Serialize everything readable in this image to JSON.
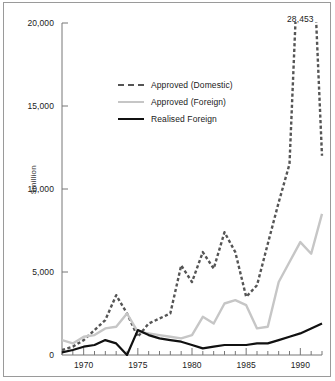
{
  "chart_data": {
    "type": "line",
    "title": "",
    "xlabel": "",
    "ylabel": "$million",
    "xlim": [
      1968,
      1992
    ],
    "ylim": [
      0,
      20000
    ],
    "yticks": [
      "0",
      "5,000",
      "10,000",
      "15,000",
      "20,000"
    ],
    "ytick_values": [
      0,
      5000,
      10000,
      15000,
      20000
    ],
    "xticks": [
      "1970",
      "1975",
      "1980",
      "1985",
      "1990"
    ],
    "xtick_values": [
      1970,
      1975,
      1980,
      1985,
      1990
    ],
    "grid": false,
    "legend_position": "upper-left-inside",
    "annotations": [
      {
        "text": "28,453",
        "x": 1990,
        "y": 20000,
        "note": "peak value of Approved (Domestic), line clipped at axis top"
      }
    ],
    "x": [
      1968,
      1969,
      1970,
      1971,
      1972,
      1973,
      1974,
      1975,
      1976,
      1977,
      1978,
      1979,
      1980,
      1981,
      1982,
      1983,
      1984,
      1985,
      1986,
      1987,
      1988,
      1989,
      1990,
      1991,
      1992
    ],
    "series": [
      {
        "name": "Approved (Domestic)",
        "color": "#555555",
        "style": "dashed",
        "values": [
          300,
          500,
          900,
          1500,
          2100,
          3600,
          2500,
          1100,
          1900,
          2200,
          2500,
          5400,
          4400,
          6200,
          5200,
          7400,
          6200,
          3500,
          4200,
          6700,
          9200,
          11500,
          28453,
          27500,
          12000
        ]
      },
      {
        "name": "Approved (Foreign)",
        "color": "#c6c6c6",
        "style": "solid",
        "values": [
          900,
          700,
          1100,
          1200,
          1600,
          1700,
          2500,
          1400,
          1300,
          1200,
          1100,
          1000,
          1200,
          2300,
          1900,
          3100,
          3300,
          3000,
          1600,
          1700,
          4400,
          5600,
          6800,
          6100,
          8500
        ]
      },
      {
        "name": "Realised Foreign",
        "color": "#111111",
        "style": "solid",
        "values": [
          150,
          300,
          500,
          600,
          900,
          700,
          0,
          1500,
          1200,
          1000,
          900,
          800,
          600,
          400,
          500,
          600,
          600,
          600,
          700,
          700,
          900,
          1100,
          1300,
          1600,
          1900
        ]
      }
    ]
  },
  "legend": {
    "items": [
      {
        "label": "Approved (Domestic)",
        "swatch": "dashed-gray"
      },
      {
        "label": "Approved (Foreign)",
        "swatch": "solid-lightgray"
      },
      {
        "label": "Realised Foreign",
        "swatch": "solid-black"
      }
    ]
  }
}
